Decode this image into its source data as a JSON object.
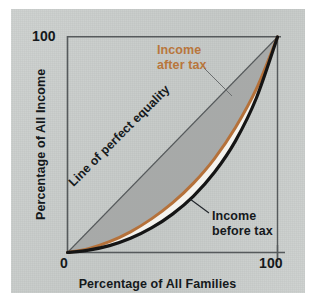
{
  "figure": {
    "panel_color": "#c8ccca",
    "canvas_color": "#ffffff"
  },
  "chart_data": {
    "type": "line",
    "title": "",
    "xlabel": "Percentage of All Families",
    "ylabel": "Percentage of All Income",
    "xlim": [
      0,
      100
    ],
    "ylim": [
      0,
      100
    ],
    "xticks": [
      "0",
      "100"
    ],
    "yticks": [
      "100"
    ],
    "grid": false,
    "legend_position": "inline-annotations",
    "annotations": [
      {
        "text": "Line of perfect equality",
        "rotation": -45,
        "color": "#15191c"
      },
      {
        "text": "Income after tax",
        "color": "#b8763c"
      },
      {
        "text": "Income before tax",
        "color": "#15191c"
      }
    ],
    "shaded_region": {
      "label": "Inequality gap",
      "color": "#a6a8a7",
      "between": [
        "Line of perfect equality",
        "Income before tax"
      ]
    },
    "x": [
      0,
      10,
      20,
      30,
      40,
      50,
      60,
      70,
      80,
      90,
      100
    ],
    "series": [
      {
        "name": "Line of perfect equality",
        "color": "#55595b",
        "width": 1,
        "values": [
          0,
          10,
          20,
          30,
          40,
          50,
          60,
          70,
          80,
          90,
          100
        ]
      },
      {
        "name": "Income after tax",
        "color": "#b5713a",
        "width": 3,
        "values": [
          0,
          1.8,
          5.0,
          9.6,
          15.6,
          23.0,
          32.2,
          43.6,
          58.0,
          76.0,
          100
        ]
      },
      {
        "name": "Income before tax",
        "color": "#151515",
        "width": 3.2,
        "values": [
          0,
          1.1,
          3.2,
          6.6,
          11.4,
          17.8,
          26.2,
          37.2,
          51.8,
          71.8,
          100
        ]
      }
    ]
  },
  "axes": {
    "y_tick_100": "100",
    "x_tick_0": "0",
    "x_tick_100": "100",
    "x_title": "Percentage of All Families",
    "y_title": "Percentage of All Income"
  },
  "labels": {
    "equality_line": "Line of perfect equality",
    "after_tax_line1": "Income",
    "after_tax_line2": "after tax",
    "before_tax_line1": "Income",
    "before_tax_line2": "before tax"
  },
  "colors": {
    "after_tax": "#b5713a",
    "before_tax": "#151515",
    "equality": "#55595b",
    "shade": "#a6a8a7",
    "axis": "#55595b",
    "text": "#15191c"
  }
}
